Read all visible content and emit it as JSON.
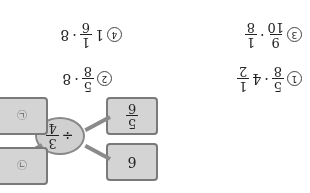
{
  "diagram": {
    "operator": "÷",
    "center": {
      "num": "3",
      "den": "4"
    },
    "inputs": [
      {
        "whole": "6"
      },
      {
        "num": "5",
        "den": "6"
      }
    ],
    "outputs": [
      {
        "label": "㉠"
      },
      {
        "label": "㉡"
      }
    ]
  },
  "options": [
    {
      "mark": "1",
      "a_num": "5",
      "a_den": "8",
      "op": "·",
      "b_whole": "4",
      "b_num": "1",
      "b_den": "2"
    },
    {
      "mark": "2",
      "a_num": "5",
      "a_den": "8",
      "op": "·",
      "b": "8"
    },
    {
      "mark": "3",
      "a_num": "9",
      "a_den": "10",
      "op": "·",
      "b_num": "1",
      "b_den": "8"
    },
    {
      "mark": "4",
      "a_whole": "1",
      "a_num": "1",
      "a_den": "6",
      "op": "·",
      "b": "8"
    }
  ],
  "colors": {
    "box": "#d4d4d4",
    "border": "#7a7a7a",
    "arrow": "#8a8a8a"
  }
}
